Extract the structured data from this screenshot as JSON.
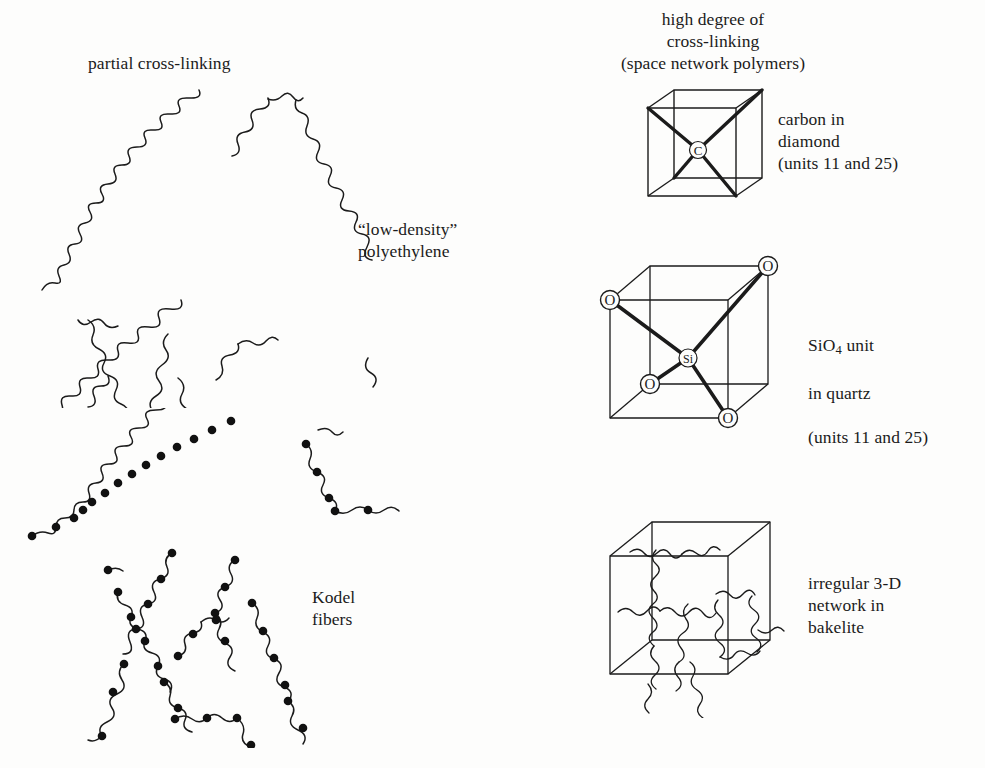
{
  "figure": {
    "title_semantic": "polymer cross-linking comparison diagram",
    "background_color": "#fdfdfc",
    "ink_color": "#1b1b1b",
    "node_color": "#111111"
  },
  "labels": {
    "partial_cross_linking": "partial cross-linking",
    "low_density_polyethylene": "“low-density”\npolyethylene",
    "kodel_fibers": "Kodel\nfibers",
    "high_degree_heading": "high degree of\ncross-linking\n(space network polymers)",
    "carbon_in_diamond": "carbon in\ndiamond\n(units 11 and 25)",
    "sio4_in_quartz_line1_pre": "SiO",
    "sio4_in_quartz_line1_sub": "4",
    "sio4_in_quartz_line1_post": " unit",
    "sio4_in_quartz_line2": "in quartz",
    "sio4_in_quartz_line3": "(units 11 and 25)",
    "irregular_network_bakelite": "irregular 3-D\nnetwork in\nbakelite"
  },
  "atoms": {
    "diamond_center": "C",
    "quartz_center": "Si",
    "quartz_oxygen": "O"
  },
  "panels": [
    {
      "id": "partial-cross-linking",
      "heading": "partial cross-linking",
      "examples": [
        "“low-density” polyethylene",
        "Kodel fibers"
      ],
      "representation": "wavy chain network"
    },
    {
      "id": "high-degree-cross-linking",
      "heading": "high degree of cross-linking (space network polymers)",
      "examples": [
        "carbon in diamond",
        "SiO4 unit in quartz",
        "irregular 3-D network in bakelite"
      ],
      "representation": "cube unit cells"
    }
  ],
  "structures": {
    "diamond": {
      "center_atom": "C",
      "bond_count": 4,
      "geometry": "tetrahedral",
      "reference_units": "units 11 and 25"
    },
    "quartz": {
      "center_atom": "Si",
      "ligand_atom": "O",
      "ligand_count": 4,
      "geometry": "tetrahedral",
      "reference_units": "units 11 and 25"
    },
    "bakelite": {
      "center_atom": null,
      "geometry": "irregular 3-D network",
      "reference_units": null
    }
  }
}
